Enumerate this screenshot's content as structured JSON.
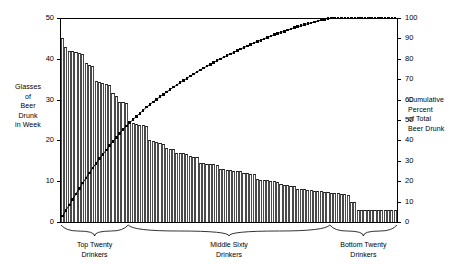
{
  "chart_data": {
    "type": "bar",
    "title": "",
    "subtitle": "",
    "ylabel": "Glasses of Beer Drunk in Week",
    "ylabel_lines": [
      "Glasses",
      "of",
      "Beer",
      "Drunk",
      "in Week"
    ],
    "ylabel_right": "Cumulative Percent of Total Beer Drunk",
    "ylabel_right_lines": [
      "Cumulative",
      "Percent",
      "of Total",
      "Beer Drunk"
    ],
    "xlabel": "",
    "grid": false,
    "legend": "none",
    "ylim": [
      0,
      50
    ],
    "ylim_right": [
      0,
      100
    ],
    "yticks": [
      0,
      10,
      20,
      30,
      40,
      50
    ],
    "yticks_right": [
      0,
      10,
      20,
      30,
      40,
      50,
      60,
      70,
      80,
      90,
      100
    ],
    "xticks": [],
    "n_categories": 100,
    "categories": [
      "1",
      "2",
      "3",
      "4",
      "5",
      "6",
      "7",
      "8",
      "9",
      "10",
      "11",
      "12",
      "13",
      "14",
      "15",
      "16",
      "17",
      "18",
      "19",
      "20",
      "21",
      "22",
      "23",
      "24",
      "25",
      "26",
      "27",
      "28",
      "29",
      "30",
      "31",
      "32",
      "33",
      "34",
      "35",
      "36",
      "37",
      "38",
      "39",
      "40",
      "41",
      "42",
      "43",
      "44",
      "45",
      "46",
      "47",
      "48",
      "49",
      "50",
      "51",
      "52",
      "53",
      "54",
      "55",
      "56",
      "57",
      "58",
      "59",
      "60",
      "61",
      "62",
      "63",
      "64",
      "65",
      "66",
      "67",
      "68",
      "69",
      "70",
      "71",
      "72",
      "73",
      "74",
      "75",
      "76",
      "77",
      "78",
      "79",
      "80",
      "81",
      "82",
      "83",
      "84",
      "85",
      "86",
      "87",
      "88",
      "89",
      "90",
      "91",
      "92",
      "93",
      "94",
      "95",
      "96",
      "97",
      "98",
      "99",
      "100"
    ],
    "series": [
      {
        "name": "Glasses of Beer Drunk in Week",
        "axis": "left",
        "type": "bar",
        "values": [
          45.0,
          43.0,
          42.0,
          41.8,
          41.6,
          41.4,
          41.2,
          39.0,
          38.6,
          38.2,
          34.5,
          34.2,
          34.0,
          33.8,
          33.6,
          31.5,
          31.0,
          29.5,
          29.3,
          29.1,
          24.5,
          24.3,
          24.1,
          23.9,
          23.7,
          23.5,
          20.0,
          19.8,
          19.6,
          19.4,
          19.2,
          18.2,
          18.0,
          17.8,
          17.0,
          16.9,
          16.8,
          16.7,
          16.1,
          16.0,
          15.9,
          14.5,
          14.4,
          14.3,
          14.2,
          14.1,
          14.0,
          13.0,
          12.9,
          12.8,
          12.7,
          12.6,
          12.5,
          12.4,
          12.0,
          11.9,
          11.8,
          11.7,
          10.5,
          10.4,
          10.3,
          10.2,
          10.1,
          10.0,
          9.8,
          9.2,
          9.1,
          9.0,
          8.9,
          8.8,
          8.2,
          8.1,
          8.0,
          7.9,
          7.8,
          7.7,
          7.6,
          7.5,
          7.4,
          7.3,
          7.2,
          7.1,
          7.0,
          6.9,
          6.8,
          6.7,
          5.0,
          5.0,
          3.0,
          2.9,
          2.9,
          2.9,
          2.9,
          2.9,
          2.9,
          2.9,
          2.9,
          2.9,
          2.9,
          2.9
        ]
      },
      {
        "name": "Cumulative Percent of Total Beer Drunk",
        "axis": "right",
        "type": "line",
        "marker": "square",
        "values": [
          2.9,
          5.7,
          8.4,
          11.1,
          13.8,
          16.4,
          19.1,
          21.6,
          24.1,
          26.5,
          28.8,
          31.0,
          33.1,
          35.3,
          37.4,
          39.5,
          41.5,
          43.4,
          45.3,
          47.1,
          48.7,
          50.2,
          51.8,
          53.3,
          54.8,
          56.3,
          57.6,
          58.9,
          60.1,
          61.4,
          62.6,
          63.8,
          64.9,
          66.1,
          67.2,
          68.3,
          69.4,
          70.4,
          71.5,
          72.5,
          73.6,
          74.5,
          75.5,
          76.4,
          77.3,
          78.2,
          79.1,
          80.0,
          80.8,
          81.6,
          82.4,
          83.2,
          84.0,
          84.8,
          85.6,
          86.3,
          87.1,
          87.8,
          88.5,
          89.1,
          89.8,
          90.5,
          91.1,
          91.8,
          92.4,
          93.0,
          93.5,
          94.1,
          94.7,
          95.2,
          95.7,
          96.2,
          96.7,
          97.2,
          97.6,
          98.1,
          98.5,
          99.0,
          99.4,
          99.8,
          100.0,
          100.0,
          100.0,
          100.0,
          100.0,
          100.0,
          100.0,
          100.0,
          100.0,
          100.0,
          100.0,
          100.0,
          100.0,
          100.0,
          100.0,
          100.0,
          100.0,
          100.0,
          100.0,
          100.0
        ]
      }
    ],
    "annotations": [
      {
        "label": "Top Twenty Drinkers",
        "lines": [
          "Top Twenty",
          "Drinkers"
        ],
        "start": 1,
        "end": 20
      },
      {
        "label": "Middle Sixty Drinkers",
        "lines": [
          "Middle Sixty",
          "Drinkers"
        ],
        "start": 21,
        "end": 80
      },
      {
        "label": "Bottom Twenty Drinkers",
        "lines": [
          "Bottom Twenty",
          "Drinkers"
        ],
        "start": 81,
        "end": 100
      }
    ],
    "colors": {
      "bar_fill": "#fdfdfd",
      "bar_edge": "#1a1a1a",
      "curve": "#000000",
      "axis": "#000000",
      "background": "#ffffff"
    }
  }
}
